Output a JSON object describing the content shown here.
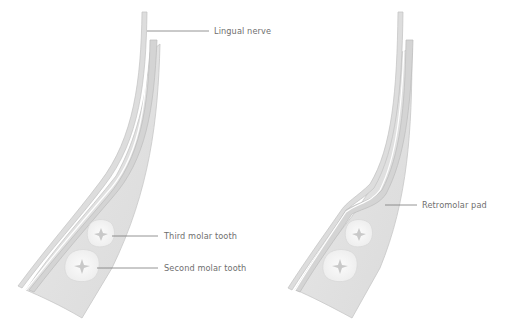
{
  "diagram": {
    "left_panel": {
      "labels": [
        {
          "id": "lingual-nerve",
          "text": "Lingual nerve"
        },
        {
          "id": "third-molar",
          "text": "Third molar tooth"
        },
        {
          "id": "second-molar",
          "text": "Second molar tooth"
        }
      ]
    },
    "right_panel": {
      "labels": [
        {
          "id": "retromolar-pad",
          "text": "Retromolar pad"
        }
      ]
    },
    "colors": {
      "bone_fill": "#e4e4e4",
      "bone_edge": "#c8c8c8",
      "nerve_fill": "#dcdcdc",
      "tooth_fill": "#f7f7f7",
      "leader_line": "#7a7a7a",
      "label_text": "#6f6f6f"
    }
  }
}
